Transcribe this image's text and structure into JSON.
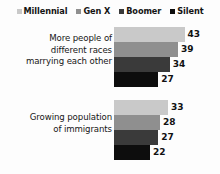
{
  "chart_data": {
    "type": "bar",
    "orientation": "horizontal",
    "grouped": true,
    "title": "",
    "subtitle": "",
    "xlabel": "",
    "ylabel": "",
    "grid": false,
    "axis_visible": false,
    "legend_position": "top",
    "value_labels": true,
    "xlim": [
      0,
      45
    ],
    "categories": [
      "More people of different races marrying each other",
      "Growing population of immigrants"
    ],
    "category_lines": [
      [
        "More people of",
        "different races",
        "marrying each other"
      ],
      [
        "Growing population",
        "of immigrants"
      ]
    ],
    "series": [
      {
        "name": "Millennial",
        "color": "#c9c9c9",
        "values": [
          43,
          33
        ]
      },
      {
        "name": "Gen X",
        "color": "#8f8f8f",
        "values": [
          39,
          28
        ]
      },
      {
        "name": "Boomer",
        "color": "#3a3a3a",
        "values": [
          34,
          27
        ]
      },
      {
        "name": "Silent",
        "color": "#0d0d0d",
        "values": [
          27,
          22
        ]
      }
    ]
  },
  "legend": {
    "items": [
      {
        "label": "Millennial",
        "color": "#c9c9c9"
      },
      {
        "label": "Gen X",
        "color": "#8f8f8f"
      },
      {
        "label": "Boomer",
        "color": "#3a3a3a"
      },
      {
        "label": "Silent",
        "color": "#0d0d0d"
      }
    ]
  },
  "groups": [
    {
      "lines": [
        "More people of",
        "different races",
        "marrying each other"
      ],
      "bars": [
        {
          "series": "Millennial",
          "value": 43,
          "color": "#c9c9c9"
        },
        {
          "series": "Gen X",
          "value": 39,
          "color": "#8f8f8f"
        },
        {
          "series": "Boomer",
          "value": 34,
          "color": "#3a3a3a"
        },
        {
          "series": "Silent",
          "value": 27,
          "color": "#0d0d0d"
        }
      ]
    },
    {
      "lines": [
        "Growing population",
        "of immigrants"
      ],
      "bars": [
        {
          "series": "Millennial",
          "value": 33,
          "color": "#c9c9c9"
        },
        {
          "series": "Gen X",
          "value": 28,
          "color": "#8f8f8f"
        },
        {
          "series": "Boomer",
          "value": 27,
          "color": "#3a3a3a"
        },
        {
          "series": "Silent",
          "value": 22,
          "color": "#0d0d0d"
        }
      ]
    }
  ],
  "scale": {
    "px_per_unit": 1.64
  }
}
